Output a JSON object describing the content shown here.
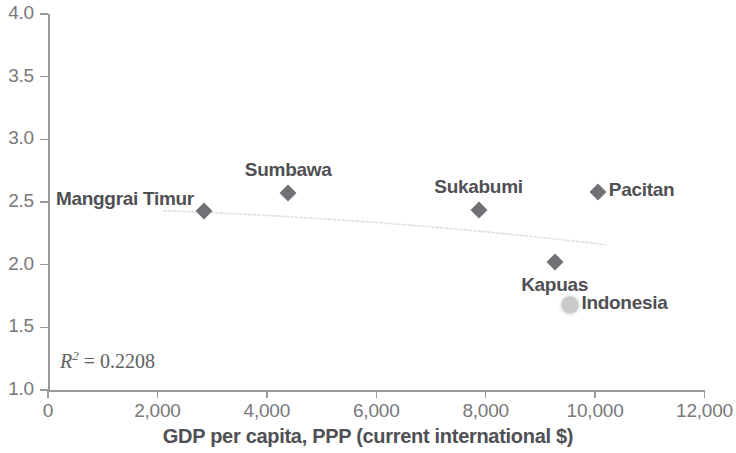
{
  "chart_data": {
    "type": "scatter",
    "title": "",
    "xlabel": "GDP per capita, PPP (current international $)",
    "ylabel": "",
    "xlim": [
      0,
      12000
    ],
    "ylim": [
      1.0,
      4.0
    ],
    "grid": false,
    "legend": "none",
    "x_ticks": [
      "0",
      "2,000",
      "4,000",
      "6,000",
      "8,000",
      "10,000",
      "12,000"
    ],
    "x_tick_values": [
      0,
      2000,
      4000,
      6000,
      8000,
      10000,
      12000
    ],
    "y_ticks": [
      "1.0",
      "1.5",
      "2.0",
      "2.5",
      "3.0",
      "3.5",
      "4.0"
    ],
    "y_tick_values": [
      1.0,
      1.5,
      2.0,
      2.5,
      3.0,
      3.5,
      4.0
    ],
    "points": [
      {
        "label": "Manggrai Timur",
        "x": 2850,
        "y": 2.43,
        "marker": "diamond",
        "label_pos": "left"
      },
      {
        "label": "Sumbawa",
        "x": 4390,
        "y": 2.57,
        "marker": "diamond",
        "label_pos": "above"
      },
      {
        "label": "Sukabumi",
        "x": 7870,
        "y": 2.44,
        "marker": "diamond",
        "label_pos": "above"
      },
      {
        "label": "Pacitan",
        "x": 10050,
        "y": 2.58,
        "marker": "diamond",
        "label_pos": "right"
      },
      {
        "label": "Kapuas",
        "x": 9260,
        "y": 2.02,
        "marker": "diamond",
        "label_pos": "below"
      },
      {
        "label": "Indonesia",
        "x": 9550,
        "y": 1.68,
        "marker": "blob",
        "label_pos": "right"
      }
    ],
    "trendline": {
      "present": true,
      "style": "dotted-faint",
      "x_start": 2120,
      "x_end": 10190,
      "y_start": 2.43,
      "y_end": 2.16
    },
    "annotation": {
      "symbol": "R",
      "exponent": "2",
      "equals": " = ",
      "value": "0.2208",
      "full_text": "R2 = 0.2208"
    },
    "colors": {
      "marker": "#6f7174",
      "highlight_marker": "#c9cacc",
      "axis": "#9a9a9a",
      "tick_text": "#77787a",
      "label_text": "#4f5053",
      "trendline": "#dedfe1",
      "background": "#ffffff"
    }
  }
}
